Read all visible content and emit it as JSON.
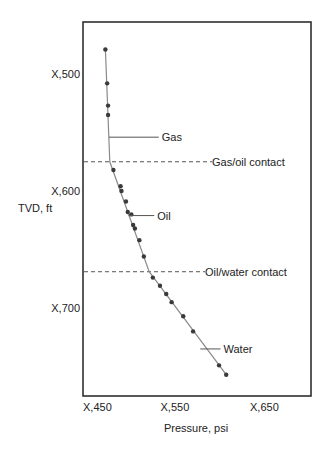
{
  "chart_data": {
    "type": "scatter",
    "title": "",
    "xlabel": "Pressure, psi",
    "ylabel": "TVD, ft",
    "xlim": [
      450,
      715
    ],
    "ylim": [
      455,
      780
    ],
    "y_inverted": true,
    "grid": false,
    "x_ticks": [
      {
        "value": 450,
        "label": "X,450"
      },
      {
        "value": 550,
        "label": "X,550"
      },
      {
        "value": 650,
        "label": "X,650"
      }
    ],
    "y_ticks": [
      {
        "value": 500,
        "label": "X,500"
      },
      {
        "value": 600,
        "label": "X,600"
      },
      {
        "value": 700,
        "label": "X,700"
      }
    ],
    "series": [
      {
        "name": "Gas",
        "points": [
          [
            475,
            479
          ],
          [
            477,
            508
          ],
          [
            478,
            527
          ],
          [
            478,
            535
          ]
        ]
      },
      {
        "name": "Oil",
        "points": [
          [
            484,
            582
          ],
          [
            492,
            596
          ],
          [
            493,
            600
          ],
          [
            498,
            609
          ],
          [
            500,
            618
          ],
          [
            504,
            620
          ],
          [
            506,
            629
          ],
          [
            508,
            632
          ],
          [
            513,
            642
          ],
          [
            518,
            656
          ]
        ]
      },
      {
        "name": "Water",
        "points": [
          [
            528,
            674
          ],
          [
            536,
            681
          ],
          [
            543,
            688
          ],
          [
            549,
            695
          ],
          [
            562,
            707
          ],
          [
            573,
            720
          ],
          [
            602,
            749
          ],
          [
            610,
            757
          ]
        ]
      }
    ],
    "gradient_line": [
      [
        475,
        479
      ],
      [
        480,
        575
      ],
      [
        524,
        669
      ],
      [
        610,
        757
      ]
    ],
    "contacts": [
      {
        "name": "Gas/oil contact",
        "depth": 575
      },
      {
        "name": "Oil/water contact",
        "depth": 669
      }
    ],
    "annotations": [
      {
        "text": "Gas",
        "anchor": [
          479,
          554
        ],
        "label_at": [
          538,
          554
        ]
      },
      {
        "text": "Oil",
        "anchor": [
          501,
          621
        ],
        "label_at": [
          533,
          621
        ]
      },
      {
        "text": "Water",
        "anchor": [
          581,
          735
        ],
        "label_at": [
          607,
          735
        ]
      }
    ],
    "colors": {
      "line": "#8a8a8a",
      "point": "#3a3a3a",
      "frame": "#222222",
      "dash": "#555555"
    }
  }
}
